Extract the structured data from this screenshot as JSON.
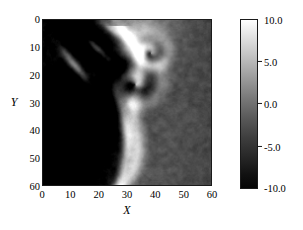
{
  "figure": {
    "background_color": "#ffffff",
    "text_color": "#000000"
  },
  "axes": {
    "x": {
      "title": "X",
      "ticks": [
        "0",
        "10",
        "20",
        "30",
        "40",
        "50",
        "60"
      ],
      "min": 0,
      "max": 60
    },
    "y": {
      "title": "Y",
      "ticks": [
        "0",
        "10",
        "20",
        "30",
        "40",
        "50",
        "60"
      ],
      "min": 0,
      "max": 60,
      "inverted": true
    }
  },
  "colorbar": {
    "ticks": [
      "10.0",
      "5.0",
      "0.0",
      "-5.0",
      "-10.0"
    ],
    "min": -10.0,
    "max": 10.0,
    "orientation": "vertical",
    "colormap": "gray",
    "top_color": "#ffffff",
    "bottom_color": "#000000"
  },
  "chart_data": {
    "type": "heatmap",
    "title": "",
    "xlabel": "X",
    "ylabel": "Y",
    "xlim": [
      0,
      60
    ],
    "ylim": [
      60,
      0
    ],
    "grid": false,
    "legend": "colorbar-right",
    "colormap": "gray",
    "zlim": [
      -10.0,
      10.0
    ],
    "x_ticks": [
      0,
      10,
      20,
      30,
      40,
      50,
      60
    ],
    "y_ticks": [
      0,
      10,
      20,
      30,
      40,
      50,
      60
    ],
    "colorbar_ticks": [
      10.0,
      5.0,
      0.0,
      -5.0,
      -10.0
    ],
    "features": [
      {
        "name": "primary-vortex-core",
        "x": 33,
        "y": 36,
        "value": -8.5
      },
      {
        "name": "secondary-vortex-core",
        "x": 38,
        "y": 48,
        "value": -8.0
      },
      {
        "name": "bright-descending-filament",
        "x": 28,
        "y": 18,
        "value": 9.5
      },
      {
        "name": "bright-lobe-right",
        "x": 36,
        "y": 53,
        "value": 8.0
      },
      {
        "name": "dark-upper-left-lobe",
        "x": 8,
        "y": 14,
        "value": -9.0
      },
      {
        "name": "bright-streak-lower-left",
        "x": 12,
        "y": 44,
        "value": 7.5
      },
      {
        "name": "background-right",
        "x": 52,
        "y": 20,
        "value": -3.0
      }
    ]
  }
}
